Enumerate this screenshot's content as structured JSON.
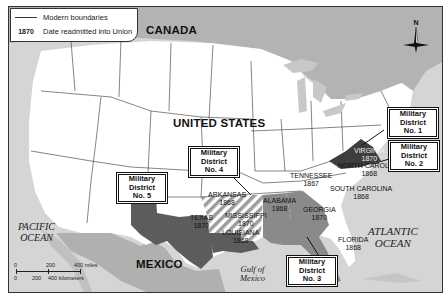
{
  "legend": {
    "items": [
      {
        "symbol": "line",
        "label": "Modern boundaries"
      },
      {
        "symbol": "1870",
        "label": "Date readmitted into Union"
      }
    ]
  },
  "countries": {
    "canada": "CANADA",
    "united_states": "UNITED STATES",
    "mexico": "MEXICO"
  },
  "water": {
    "pacific": [
      "PACIFIC",
      "OCEAN"
    ],
    "atlantic": [
      "ATLANTIC",
      "OCEAN"
    ],
    "gulf": [
      "Gulf of",
      "Mexico"
    ]
  },
  "compass": {
    "north_label": "N"
  },
  "states": [
    {
      "name": "VIRGINIA",
      "year": "1870"
    },
    {
      "name": "NORTH CAROLINA",
      "year": "1868"
    },
    {
      "name": "TENNESSEE",
      "year": "1867"
    },
    {
      "name": "SOUTH CAROLINA",
      "year": "1868"
    },
    {
      "name": "ARKANSAS",
      "year": "1868"
    },
    {
      "name": "ALABAMA",
      "year": "1868"
    },
    {
      "name": "GEORGIA",
      "year": "1870"
    },
    {
      "name": "MISSISSIPPI",
      "year": "1870"
    },
    {
      "name": "TEXAS",
      "year": "1870"
    },
    {
      "name": "LOUISIANA",
      "year": "1868"
    },
    {
      "name": "FLORIDA",
      "year": "1868"
    }
  ],
  "districts": [
    {
      "line1": "Military District",
      "line2": "No. 1",
      "states": [
        "Virginia"
      ]
    },
    {
      "line1": "Military District",
      "line2": "No. 2",
      "states": [
        "North Carolina",
        "South Carolina"
      ]
    },
    {
      "line1": "Military District",
      "line2": "No. 3",
      "states": [
        "Georgia",
        "Alabama",
        "Florida"
      ]
    },
    {
      "line1": "Military District",
      "line2": "No. 4",
      "states": [
        "Arkansas",
        "Mississippi"
      ]
    },
    {
      "line1": "Military District",
      "line2": "No. 5",
      "states": [
        "Texas",
        "Louisiana"
      ]
    }
  ],
  "scale": {
    "miles": [
      "0",
      "200",
      "400 miles"
    ],
    "kilometers": [
      "0",
      "200",
      "400 kilometers"
    ]
  },
  "colors": {
    "water": "#d7d7d7",
    "foreign_land": "#a9a9a9",
    "us_land": "#ffffff",
    "district1": "#3e3e3e",
    "district2": "#ffffff",
    "district3": "#8a8a8a",
    "district4_stripe": "#9a9a9a",
    "district5": "#5e5e5e"
  }
}
